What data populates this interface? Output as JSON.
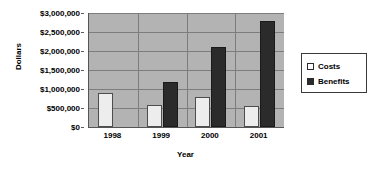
{
  "chart_data": {
    "type": "bar",
    "title": "",
    "xlabel": "Year",
    "ylabel": "Dollars",
    "categories": [
      "1998",
      "1999",
      "2000",
      "2001"
    ],
    "series": [
      {
        "name": "Costs",
        "values": [
          900000,
          570000,
          780000,
          550000
        ]
      },
      {
        "name": "Benefits",
        "values": [
          0,
          1180000,
          2100000,
          2800000
        ]
      }
    ],
    "ylim": [
      0,
      3000000
    ],
    "ytick_labels": [
      "$0",
      "$500,000",
      "$1,000,000",
      "$1,500,000",
      "$2,000,000",
      "$2,500,000",
      "$3,000,000"
    ],
    "ytick_values": [
      0,
      500000,
      1000000,
      1500000,
      2000000,
      2500000,
      3000000
    ],
    "grid": true,
    "legend_position": "right",
    "colors": {
      "costs": "#ededed",
      "benefits": "#2b2b2b",
      "plot_background": "#b3b3b3",
      "gridline": "#7d7d7d",
      "axis": "#555555",
      "page_background": "#ffffff"
    }
  },
  "legend": {
    "items": [
      {
        "label": "Costs",
        "swatch": "square-light-icon"
      },
      {
        "label": "Benefits",
        "swatch": "square-dark-icon"
      }
    ]
  }
}
